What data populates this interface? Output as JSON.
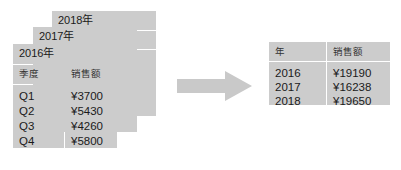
{
  "diagram": {
    "title_suffix": "年",
    "arrow": {
      "name": "right-arrow",
      "color": "#c9c9c9"
    },
    "source_cards": [
      {
        "year_label": "2018年",
        "year": "2018",
        "columns": [
          "季度",
          "销售额"
        ],
        "rows": [
          {
            "quarter": "Q1",
            "amount": "¥3700"
          },
          {
            "quarter": "Q2",
            "amount": "¥5430"
          },
          {
            "quarter": "Q3",
            "amount": "¥4260"
          },
          {
            "quarter": "Q4",
            "amount": "¥5800"
          }
        ]
      },
      {
        "year_label": "2017年",
        "year": "2017",
        "columns": [
          "季度",
          "销售额"
        ],
        "rows": [
          {
            "quarter": "Q1",
            "amount": "¥3700"
          },
          {
            "quarter": "Q2",
            "amount": "¥5430"
          },
          {
            "quarter": "Q3",
            "amount": "¥4260"
          },
          {
            "quarter": "Q4",
            "amount": "¥5800"
          }
        ]
      },
      {
        "year_label": "2016年",
        "year": "2016",
        "columns": [
          "季度",
          "销售额"
        ],
        "rows": [
          {
            "quarter": "Q1",
            "amount": "¥3700"
          },
          {
            "quarter": "Q2",
            "amount": "¥5430"
          },
          {
            "quarter": "Q3",
            "amount": "¥4260"
          },
          {
            "quarter": "Q4",
            "amount": "¥5800"
          }
        ]
      }
    ],
    "summary_table": {
      "columns": [
        "年",
        "销售额"
      ],
      "rows": [
        {
          "year": "2016",
          "amount": "¥19190"
        },
        {
          "year": "2017",
          "amount": "¥16238"
        },
        {
          "year": "2018",
          "amount": "¥19650"
        }
      ]
    },
    "colors": {
      "fill": "#cccccc",
      "background": "#ffffff",
      "text": "#1a1a1a"
    }
  }
}
